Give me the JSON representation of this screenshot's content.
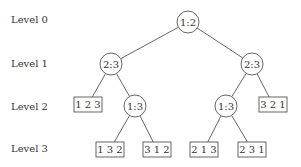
{
  "diagram": {
    "type": "decision-tree",
    "levels": [
      {
        "label": "Level 0",
        "y": 20
      },
      {
        "label": "Level 1",
        "y": 64
      },
      {
        "label": "Level 2",
        "y": 107
      },
      {
        "label": "Level 3",
        "y": 149
      }
    ],
    "nodes": {
      "root": {
        "kind": "comparison",
        "label": "1:2",
        "cx": 188,
        "cy": 22
      },
      "l1_left": {
        "kind": "comparison",
        "label": "2:3",
        "cx": 111,
        "cy": 64
      },
      "l1_right": {
        "kind": "comparison",
        "label": "2:3",
        "cx": 252,
        "cy": 64
      },
      "l2_leaf_123": {
        "kind": "leaf",
        "label": "1 2 3",
        "x": 74,
        "y": 97,
        "w": 28,
        "h": 15
      },
      "l2_left_13": {
        "kind": "comparison",
        "label": "1:3",
        "cx": 135,
        "cy": 106
      },
      "l2_right_13": {
        "kind": "comparison",
        "label": "1:3",
        "cx": 226,
        "cy": 106
      },
      "l2_leaf_321": {
        "kind": "leaf",
        "label": "3 2 1",
        "x": 259,
        "y": 97,
        "w": 28,
        "h": 15
      },
      "l3_leaf_132": {
        "kind": "leaf",
        "label": "1 3 2",
        "x": 96,
        "y": 142,
        "w": 28,
        "h": 15
      },
      "l3_leaf_312": {
        "kind": "leaf",
        "label": "3 1 2",
        "x": 143,
        "y": 142,
        "w": 28,
        "h": 15
      },
      "l3_leaf_213": {
        "kind": "leaf",
        "label": "2 1 3",
        "x": 190,
        "y": 142,
        "w": 28,
        "h": 15
      },
      "l3_leaf_231": {
        "kind": "leaf",
        "label": "2 3 1",
        "x": 238,
        "y": 142,
        "w": 28,
        "h": 15
      }
    },
    "edges": [
      [
        "root",
        "l1_left"
      ],
      [
        "root",
        "l1_right"
      ],
      [
        "l1_left",
        "l2_leaf_123"
      ],
      [
        "l1_left",
        "l2_left_13"
      ],
      [
        "l1_right",
        "l2_right_13"
      ],
      [
        "l1_right",
        "l2_leaf_321"
      ],
      [
        "l2_left_13",
        "l3_leaf_132"
      ],
      [
        "l2_left_13",
        "l3_leaf_312"
      ],
      [
        "l2_right_13",
        "l3_leaf_213"
      ],
      [
        "l2_right_13",
        "l3_leaf_231"
      ]
    ],
    "circle_radius": 11,
    "colors": {
      "stroke": "#555555",
      "text": "#333333",
      "background": "#ffffff"
    }
  }
}
